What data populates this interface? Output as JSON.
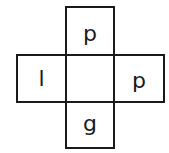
{
  "diagram": {
    "type": "cube-net",
    "cells": {
      "top": "p",
      "left": "l",
      "center": "",
      "right": "p",
      "bottom": "g"
    }
  }
}
